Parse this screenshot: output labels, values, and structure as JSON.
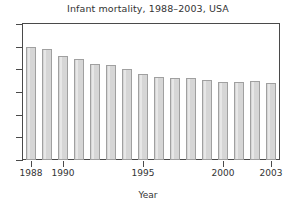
{
  "chart_data": {
    "type": "bar",
    "title": "Infant mortality, 1988–2003, USA",
    "xlabel": "Year",
    "ylabel": "",
    "categories": [
      "1988",
      "1989",
      "1990",
      "1991",
      "1992",
      "1993",
      "1994",
      "1995",
      "1996",
      "1997",
      "1998",
      "1999",
      "2000",
      "2001",
      "2002",
      "2003"
    ],
    "values": [
      10.0,
      9.8,
      9.2,
      8.9,
      8.5,
      8.4,
      8.0,
      7.6,
      7.3,
      7.2,
      7.2,
      7.1,
      6.9,
      6.9,
      7.0,
      6.8
    ],
    "ylim": [
      0,
      12
    ],
    "yticks": [
      0,
      2,
      4,
      6,
      8,
      10,
      12
    ],
    "ytick_labels": [
      "",
      "",
      "",
      "",
      "",
      "",
      ""
    ],
    "xlim": [
      1987.5,
      2003.5
    ],
    "xticks": [
      1988,
      1990,
      1995,
      2000,
      2003
    ],
    "xtick_labels": [
      "1988",
      "1990",
      "1995",
      "2000",
      "2003"
    ],
    "grid": false,
    "legend": null,
    "bar_fill_color": "#d6d6d6",
    "bar_edge_color": "#a0a0a0",
    "axis_color": "#4a4a4a",
    "background_color": "#ffffff"
  }
}
